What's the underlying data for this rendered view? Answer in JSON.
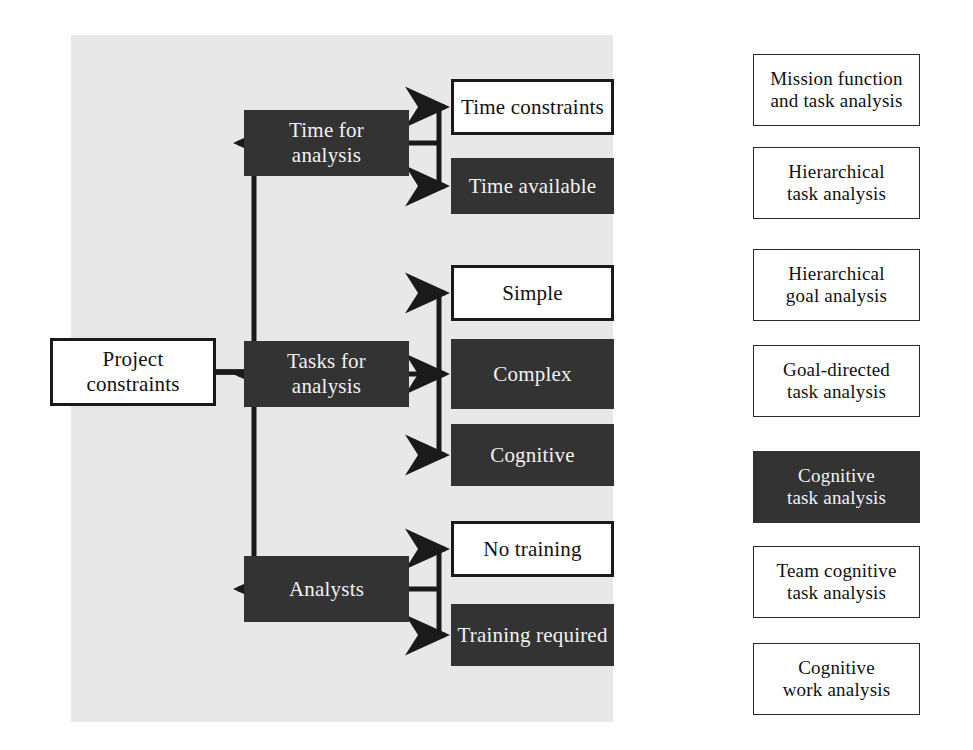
{
  "diagram": {
    "colors": {
      "panel_background": "#e8e8e8",
      "dark_fill": "#333333",
      "dark_text": "#f2f2f2",
      "light_fill": "#ffffff",
      "light_text": "#111111",
      "stroke": "#1a1a1a",
      "page_background": "#ffffff"
    },
    "root": {
      "label": "Project constraints",
      "line1": "Project",
      "line2": "constraints",
      "style": "light"
    },
    "level2": [
      {
        "id": "time-for-analysis",
        "line1": "Time for",
        "line2": "analysis",
        "label": "Time for analysis",
        "style": "dark"
      },
      {
        "id": "tasks-for-analysis",
        "line1": "Tasks for",
        "line2": "analysis",
        "label": "Tasks for analysis",
        "style": "dark"
      },
      {
        "id": "analysts",
        "line1": "Analysts",
        "line2": "",
        "label": "Analysts",
        "style": "dark"
      }
    ],
    "level3": [
      {
        "id": "time-constraints",
        "line1": "Time constraints",
        "line2": "",
        "label": "Time constraints",
        "style": "light",
        "parent": "time-for-analysis"
      },
      {
        "id": "time-available",
        "line1": "Time available",
        "line2": "",
        "label": "Time available",
        "style": "dark",
        "parent": "time-for-analysis"
      },
      {
        "id": "simple",
        "line1": "Simple",
        "line2": "",
        "label": "Simple",
        "style": "light",
        "parent": "tasks-for-analysis"
      },
      {
        "id": "complex",
        "line1": "Complex",
        "line2": "",
        "label": "Complex",
        "style": "dark",
        "parent": "tasks-for-analysis"
      },
      {
        "id": "cognitive",
        "line1": "Cognitive",
        "line2": "",
        "label": "Cognitive",
        "style": "dark",
        "parent": "tasks-for-analysis"
      },
      {
        "id": "no-training",
        "line1": "No training",
        "line2": "",
        "label": "No training",
        "style": "light",
        "parent": "analysts"
      },
      {
        "id": "training-required",
        "line1": "Training required",
        "line2": "",
        "label": "Training required",
        "style": "dark",
        "parent": "analysts"
      }
    ],
    "methods": [
      {
        "id": "mission-function",
        "line1": "Mission function",
        "line2": "and task analysis",
        "label": "Mission function and task analysis",
        "style": "light-thin"
      },
      {
        "id": "hierarchical-task",
        "line1": "Hierarchical",
        "line2": "task analysis",
        "label": "Hierarchical task analysis",
        "style": "light-thin"
      },
      {
        "id": "hierarchical-goal",
        "line1": "Hierarchical",
        "line2": "goal analysis",
        "label": "Hierarchical goal analysis",
        "style": "light-thin"
      },
      {
        "id": "goal-directed",
        "line1": "Goal-directed",
        "line2": "task analysis",
        "label": "Goal-directed task analysis",
        "style": "light-thin"
      },
      {
        "id": "cognitive-task",
        "line1": "Cognitive",
        "line2": "task analysis",
        "label": "Cognitive task analysis",
        "style": "dark"
      },
      {
        "id": "team-cognitive",
        "line1": "Team cognitive",
        "line2": "task analysis",
        "label": "Team cognitive task analysis",
        "style": "light-thin"
      },
      {
        "id": "cognitive-work",
        "line1": "Cognitive",
        "line2": "work analysis",
        "label": "Cognitive work analysis",
        "style": "light-thin"
      }
    ],
    "links": [
      {
        "from": "time-constraints",
        "to": "hierarchical-task"
      },
      {
        "from": "time-constraints",
        "to": "goal-directed"
      },
      {
        "from": "time-available",
        "to": "mission-function"
      },
      {
        "from": "time-available",
        "to": "hierarchical-goal"
      },
      {
        "from": "time-available",
        "to": "cognitive-task"
      },
      {
        "from": "time-available",
        "to": "team-cognitive"
      },
      {
        "from": "time-available",
        "to": "cognitive-work"
      },
      {
        "from": "time-available",
        "to": "goal-directed"
      },
      {
        "from": "simple",
        "to": "hierarchical-task"
      },
      {
        "from": "complex",
        "to": "mission-function"
      },
      {
        "from": "complex",
        "to": "goal-directed"
      },
      {
        "from": "complex",
        "to": "cognitive-task"
      },
      {
        "from": "cognitive",
        "to": "hierarchical-goal"
      },
      {
        "from": "cognitive",
        "to": "cognitive-task"
      },
      {
        "from": "cognitive",
        "to": "team-cognitive"
      },
      {
        "from": "cognitive",
        "to": "cognitive-work"
      },
      {
        "from": "no-training",
        "to": "mission-function"
      },
      {
        "from": "no-training",
        "to": "hierarchical-task"
      },
      {
        "from": "training-required",
        "to": "mission-function"
      },
      {
        "from": "training-required",
        "to": "hierarchical-goal"
      },
      {
        "from": "training-required",
        "to": "cognitive-task"
      },
      {
        "from": "training-required",
        "to": "team-cognitive"
      },
      {
        "from": "training-required",
        "to": "cognitive-work"
      }
    ]
  }
}
